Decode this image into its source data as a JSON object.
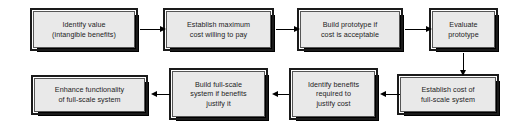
{
  "diagram": {
    "background_color": "#ffffff",
    "box_fill_color": "#e9e9e9",
    "box_border_color": "#1a1a1a",
    "shadow_color": "#000000",
    "text_color": "#1d1d1d",
    "nodes": [
      {
        "id": "identify-value",
        "text": "Identify value\n(intangible benefits)",
        "x": 33,
        "y": 11,
        "w": 102,
        "h": 37
      },
      {
        "id": "establish-maximum-cost",
        "text": "Establish maximum\ncost willing to pay",
        "x": 166,
        "y": 11,
        "w": 105,
        "h": 37
      },
      {
        "id": "build-prototype",
        "text": "Build prototype if\ncost is acceptable",
        "x": 300,
        "y": 11,
        "w": 100,
        "h": 37
      },
      {
        "id": "evaluate-prototype",
        "text": "Evaluate\nprototype",
        "x": 432,
        "y": 11,
        "w": 63,
        "h": 37
      },
      {
        "id": "establish-cost-full-scale",
        "text": "Establish cost of\nfull-scale system",
        "x": 400,
        "y": 77,
        "w": 96,
        "h": 35
      },
      {
        "id": "identify-benefits",
        "text": "Identify benefits\nrequired to\njustify cost",
        "x": 292,
        "y": 71,
        "w": 83,
        "h": 46
      },
      {
        "id": "build-full-scale",
        "text": "Build full-scale\nsystem if benefits\njustify it",
        "x": 172,
        "y": 71,
        "w": 93,
        "h": 46
      },
      {
        "id": "enhance-functionality",
        "text": "Enhance functionality\nof full-scale system",
        "x": 34,
        "y": 78,
        "w": 111,
        "h": 34
      }
    ],
    "connectors": [
      {
        "id": "identify-value-to-establish-maximum-cost",
        "direction": "right"
      },
      {
        "id": "establish-maximum-cost-to-build-prototype",
        "direction": "right"
      },
      {
        "id": "build-prototype-to-evaluate-prototype",
        "direction": "right"
      },
      {
        "id": "evaluate-prototype-to-establish-cost-full-scale",
        "direction": "down"
      },
      {
        "id": "establish-cost-full-scale-to-identify-benefits",
        "direction": "left"
      },
      {
        "id": "identify-benefits-to-build-full-scale",
        "direction": "left"
      },
      {
        "id": "build-full-scale-to-enhance-functionality",
        "direction": "left"
      }
    ]
  }
}
